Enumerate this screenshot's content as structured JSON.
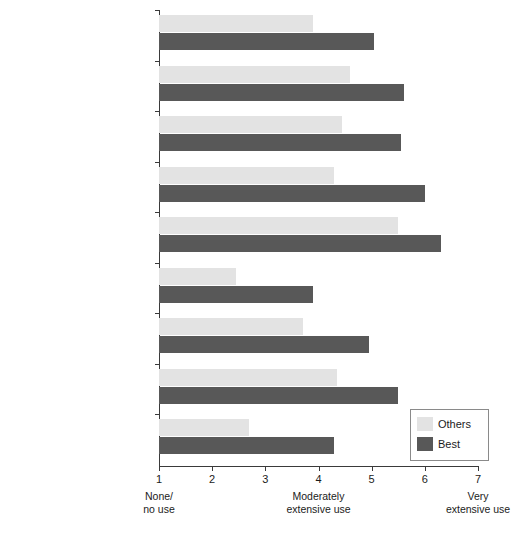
{
  "chart_data": {
    "type": "bar",
    "orientation": "horizontal",
    "title": "",
    "xlabel": "",
    "ylabel": "",
    "xlim": [
      1,
      7
    ],
    "grid": false,
    "legend_position": "bottom-right",
    "xticks": [
      "1",
      "2",
      "3",
      "4",
      "5",
      "6",
      "7"
    ],
    "x_anchor_labels": [
      {
        "value": 1,
        "text": "None/\nno use"
      },
      {
        "value": 4,
        "text": "Moderately\nextensive use"
      },
      {
        "value": 7,
        "text": "Very\nextensive use"
      }
    ],
    "categories": [
      "Formalized processes\nto select purchased items\nfor supplier integration",
      "Cross-functional team\nfor supplier selection and\nplanning integration effort",
      "Early supplier selection for\nboth design work and full\nvolume production",
      "Supplier membership and\nparticipation on the buying\ncompany's project team",
      "Direct cross-functional\nintercompany communication\nduring the project",
      "Co-location of buyer and\nsupplier company personnel",
      "Formal business unit trust\ndevelopment efforts",
      "Sharing of technology\nbetween buyer and supplier\ncompanies",
      "Joint education/training\nefforts between buyer and\nsupplier companies"
    ],
    "series": [
      {
        "name": "Others",
        "color": "#e3e3e3",
        "values": [
          3.9,
          4.6,
          4.45,
          4.3,
          5.5,
          2.45,
          3.7,
          4.35,
          2.7
        ]
      },
      {
        "name": "Best",
        "color": "#585858",
        "values": [
          5.05,
          5.6,
          5.55,
          6.0,
          6.3,
          3.9,
          4.95,
          5.5,
          4.3
        ]
      }
    ]
  },
  "legend": {
    "items": [
      {
        "label": "Others"
      },
      {
        "label": "Best"
      }
    ]
  }
}
